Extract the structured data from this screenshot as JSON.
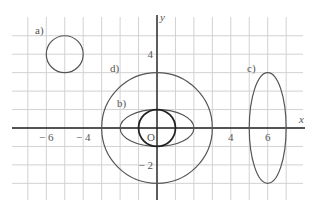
{
  "diagram": {
    "type": "coordinate-plane-conics",
    "colors": {
      "grid": "#d2d2d2",
      "axis": "#222222",
      "curve": "#555555",
      "bold_curve": "#222222",
      "text": "#555555"
    },
    "axes": {
      "x_label": "x",
      "y_label": "y",
      "origin_label": "O",
      "x_range": [
        -7.5,
        8
      ],
      "y_range": [
        -4,
        6
      ],
      "x_ticks": [
        {
          "value": -6,
          "label": "− 6"
        },
        {
          "value": -4,
          "label": "− 4"
        },
        {
          "value": 4,
          "label": "4"
        },
        {
          "value": 6,
          "label": "6"
        }
      ],
      "y_ticks": [
        {
          "value": 4,
          "label": "4"
        },
        {
          "value": -2,
          "label": "− 2"
        }
      ]
    },
    "curves": [
      {
        "id": "a",
        "label": "a)",
        "shape": "circle",
        "cx": -5,
        "cy": 4,
        "rx": 1,
        "ry": 1
      },
      {
        "id": "b",
        "label": "b)",
        "shape": "ellipse",
        "cx": 0,
        "cy": 0,
        "rx": 2,
        "ry": 1
      },
      {
        "id": "c",
        "label": "c)",
        "shape": "ellipse",
        "cx": 6,
        "cy": 0,
        "rx": 1,
        "ry": 3
      },
      {
        "id": "d",
        "label": "d)",
        "shape": "circle",
        "cx": 0,
        "cy": 0,
        "rx": 3,
        "ry": 3
      },
      {
        "id": "unit",
        "label": "",
        "shape": "circle",
        "cx": 0,
        "cy": 0,
        "rx": 1,
        "ry": 1,
        "bold": true
      }
    ]
  }
}
